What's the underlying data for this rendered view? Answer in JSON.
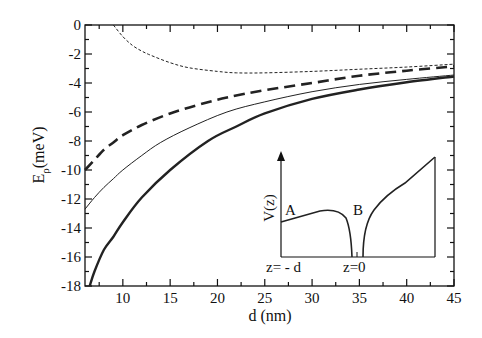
{
  "chart_data": {
    "type": "line",
    "title": "",
    "xlabel": "d (nm)",
    "ylabel": "E_ρ(meV)",
    "ylabel_main": "E",
    "ylabel_sub": "ρ",
    "ylabel_unit": "(meV)",
    "xlim": [
      6,
      45
    ],
    "ylim": [
      -18,
      0
    ],
    "xticks": [
      10,
      15,
      20,
      25,
      30,
      35,
      40,
      45
    ],
    "yticks": [
      0,
      -2,
      -4,
      -6,
      -8,
      -10,
      -12,
      -14,
      -16,
      -18
    ],
    "grid": false,
    "legend": null,
    "series": [
      {
        "name": "thin-dashed",
        "style": "dashed-thin",
        "x": [
          9,
          10,
          11,
          12,
          13,
          15,
          17,
          20,
          22,
          25,
          30,
          35,
          40,
          45
        ],
        "y": [
          0,
          -0.8,
          -1.4,
          -1.8,
          -2.1,
          -2.6,
          -2.95,
          -3.2,
          -3.3,
          -3.3,
          -3.2,
          -3.05,
          -2.9,
          -2.7
        ]
      },
      {
        "name": "thick-dashed",
        "style": "dashed-thick",
        "x": [
          6,
          7,
          8,
          9,
          10,
          12,
          15,
          18,
          21,
          25,
          30,
          35,
          40,
          45
        ],
        "y": [
          -10,
          -9.3,
          -8.6,
          -8.1,
          -7.6,
          -6.9,
          -6.1,
          -5.5,
          -5.0,
          -4.5,
          -4.0,
          -3.5,
          -3.15,
          -2.85
        ]
      },
      {
        "name": "thin-solid",
        "style": "solid-thin",
        "x": [
          6,
          7,
          8,
          9,
          10,
          12,
          14,
          17,
          21,
          25,
          30,
          35,
          40,
          45
        ],
        "y": [
          -12.7,
          -11.9,
          -11.2,
          -10.6,
          -10.0,
          -9.0,
          -8.1,
          -7.1,
          -6.0,
          -5.3,
          -4.6,
          -4.1,
          -3.75,
          -3.45
        ]
      },
      {
        "name": "thick-solid",
        "style": "solid-thick",
        "x": [
          6.5,
          7,
          8,
          9,
          10,
          12,
          15,
          19,
          22,
          25,
          30,
          35,
          40,
          45
        ],
        "y": [
          -18,
          -17.0,
          -15.5,
          -14.6,
          -13.6,
          -11.9,
          -10.0,
          -8.0,
          -7.0,
          -6.1,
          -5.1,
          -4.45,
          -3.95,
          -3.55
        ]
      }
    ],
    "inset": {
      "ylabel": "V(z)",
      "label_a": "A",
      "label_b": "B",
      "xlabel_left": "z= - d",
      "xlabel_right": "z=0",
      "description": "Potential profile V(z): barrier A from z=-d rising slowly then dropping into a well at z=0; B side rising sharply."
    }
  },
  "colors": {
    "axis": "#111111",
    "curve": "#222222",
    "background": "#ffffff"
  }
}
